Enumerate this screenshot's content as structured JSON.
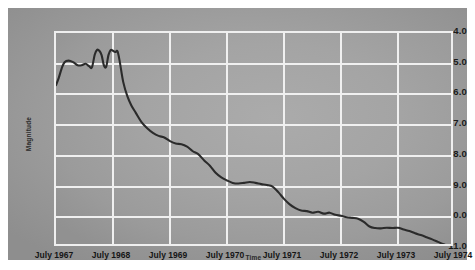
{
  "chart_data": {
    "type": "line",
    "title": "",
    "xlabel": "Time",
    "ylabel": "Magnitude",
    "grid": true,
    "legend": "none",
    "y_inverted": true,
    "ylim": [
      4.0,
      11.0
    ],
    "yticks": [
      "4.0",
      "5.0",
      "6.0",
      "7.0",
      "8.0",
      "9.0",
      "10.0",
      "11.0"
    ],
    "ytick_values": [
      4.0,
      5.0,
      6.0,
      7.0,
      8.0,
      9.0,
      10.0,
      11.0
    ],
    "xlim": [
      "July 1967",
      "July 1974"
    ],
    "xticks": [
      "July 1967",
      "July 1968",
      "July 1969",
      "July 1970",
      "July 1971",
      "July 1972",
      "July 1973",
      "July 1974"
    ],
    "xtick_values": [
      1967.5,
      1968.5,
      1969.5,
      1970.5,
      1971.5,
      1972.5,
      1973.5,
      1974.5
    ],
    "series": [
      {
        "name": "Light curve",
        "color": "#2b2b2b",
        "x": [
          1967.5,
          1967.55,
          1967.6,
          1967.65,
          1967.72,
          1967.8,
          1967.88,
          1967.95,
          1968.02,
          1968.08,
          1968.13,
          1968.18,
          1968.22,
          1968.26,
          1968.3,
          1968.34,
          1968.38,
          1968.42,
          1968.46,
          1968.5,
          1968.54,
          1968.58,
          1968.62,
          1968.68,
          1968.75,
          1968.82,
          1968.9,
          1969.0,
          1969.1,
          1969.2,
          1969.3,
          1969.4,
          1969.5,
          1969.6,
          1969.7,
          1969.8,
          1969.9,
          1970.0,
          1970.1,
          1970.2,
          1970.3,
          1970.4,
          1970.5,
          1970.6,
          1970.7,
          1970.8,
          1970.9,
          1971.0,
          1971.1,
          1971.2,
          1971.3,
          1971.4,
          1971.5,
          1971.6,
          1971.7,
          1971.8,
          1971.9,
          1972.0,
          1972.1,
          1972.2,
          1972.3,
          1972.4,
          1972.5,
          1972.6,
          1972.7,
          1972.8,
          1972.9,
          1973.0,
          1973.1,
          1973.2,
          1973.3,
          1973.4,
          1973.5,
          1973.6,
          1973.7,
          1973.8,
          1973.9,
          1974.0,
          1974.1,
          1974.2,
          1974.3,
          1974.4,
          1974.5
        ],
        "y": [
          5.7,
          5.45,
          5.15,
          4.95,
          4.9,
          4.95,
          5.05,
          5.05,
          5.0,
          5.08,
          5.12,
          4.7,
          4.55,
          4.58,
          4.72,
          5.05,
          5.1,
          4.72,
          4.55,
          4.58,
          4.62,
          4.6,
          4.95,
          5.6,
          6.05,
          6.35,
          6.6,
          6.9,
          7.1,
          7.25,
          7.35,
          7.4,
          7.52,
          7.6,
          7.62,
          7.7,
          7.85,
          7.95,
          8.15,
          8.32,
          8.55,
          8.7,
          8.8,
          8.88,
          8.9,
          8.88,
          8.85,
          8.88,
          8.92,
          8.95,
          9.0,
          9.18,
          9.4,
          9.58,
          9.7,
          9.78,
          9.8,
          9.85,
          9.82,
          9.88,
          9.85,
          9.92,
          9.95,
          10.0,
          10.02,
          10.05,
          10.15,
          10.3,
          10.35,
          10.36,
          10.34,
          10.35,
          10.34,
          10.4,
          10.45,
          10.52,
          10.58,
          10.65,
          10.72,
          10.8,
          10.88,
          10.95,
          11.0
        ]
      }
    ]
  },
  "axes": {
    "y_title": "Magnitude",
    "x_title": "Time"
  }
}
